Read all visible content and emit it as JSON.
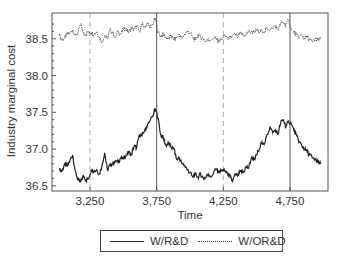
{
  "chart_data": {
    "type": "line",
    "title": "",
    "xlabel": "Time",
    "ylabel": "Industry marginal cost",
    "xlim": [
      2965,
      5035
    ],
    "ylim": [
      36.43,
      38.85
    ],
    "xticks": [
      3250,
      3750,
      4250,
      4750
    ],
    "xtick_labels": [
      "3,250",
      "3,750",
      "4,250",
      "4,750"
    ],
    "yticks": [
      36.5,
      37.0,
      37.5,
      38.0,
      38.5
    ],
    "ytick_labels": [
      "36.5",
      "37.0",
      "37.5",
      "38.0",
      "38.5"
    ],
    "grid": false,
    "vertical_lines": [
      {
        "x": 3250,
        "style": "dashed"
      },
      {
        "x": 3750,
        "style": "solid"
      },
      {
        "x": 4250,
        "style": "dashed"
      },
      {
        "x": 4750,
        "style": "solid"
      }
    ],
    "legend_position": "bottom",
    "series": [
      {
        "name": "W/R&D",
        "style": "solid",
        "x": [
          3020,
          3040,
          3060,
          3080,
          3100,
          3120,
          3140,
          3160,
          3180,
          3200,
          3220,
          3240,
          3260,
          3280,
          3300,
          3320,
          3340,
          3360,
          3380,
          3400,
          3420,
          3440,
          3460,
          3480,
          3500,
          3520,
          3540,
          3560,
          3580,
          3600,
          3620,
          3640,
          3660,
          3680,
          3700,
          3720,
          3740,
          3760,
          3780,
          3800,
          3820,
          3840,
          3860,
          3880,
          3900,
          3920,
          3940,
          3960,
          3980,
          4000,
          4020,
          4040,
          4060,
          4080,
          4100,
          4120,
          4140,
          4160,
          4180,
          4200,
          4220,
          4240,
          4260,
          4280,
          4300,
          4320,
          4340,
          4360,
          4380,
          4400,
          4420,
          4440,
          4460,
          4480,
          4500,
          4520,
          4540,
          4560,
          4580,
          4600,
          4620,
          4640,
          4660,
          4680,
          4700,
          4720,
          4740,
          4760,
          4780,
          4800,
          4820,
          4840,
          4860,
          4880,
          4900,
          4920,
          4940,
          4960,
          4980
        ],
        "values": [
          36.72,
          36.7,
          36.8,
          36.76,
          36.85,
          36.92,
          36.7,
          36.58,
          36.55,
          36.64,
          36.58,
          36.6,
          36.72,
          36.7,
          36.72,
          36.66,
          36.78,
          36.95,
          36.72,
          36.78,
          36.8,
          36.84,
          36.82,
          36.88,
          36.86,
          36.92,
          36.96,
          36.92,
          37.04,
          37.02,
          37.2,
          37.18,
          37.26,
          37.32,
          37.38,
          37.45,
          37.55,
          37.42,
          37.2,
          37.15,
          37.05,
          37.08,
          37.02,
          37.0,
          36.86,
          36.88,
          36.8,
          36.78,
          36.72,
          36.68,
          36.62,
          36.66,
          36.62,
          36.66,
          36.6,
          36.62,
          36.66,
          36.62,
          36.7,
          36.72,
          36.68,
          36.72,
          36.7,
          36.68,
          36.62,
          36.56,
          36.66,
          36.64,
          36.7,
          36.68,
          36.76,
          36.74,
          36.88,
          36.86,
          36.92,
          37.0,
          37.1,
          37.08,
          37.2,
          37.3,
          37.22,
          37.26,
          37.2,
          37.36,
          37.4,
          37.3,
          37.38,
          37.34,
          37.25,
          37.18,
          37.1,
          37.04,
          37.0,
          36.96,
          36.92,
          36.88,
          36.86,
          36.82,
          36.8
        ]
      },
      {
        "name": "W/OR&D",
        "style": "dotted",
        "x": [
          3020,
          3040,
          3060,
          3080,
          3100,
          3120,
          3140,
          3160,
          3180,
          3200,
          3220,
          3240,
          3260,
          3280,
          3300,
          3320,
          3340,
          3360,
          3380,
          3400,
          3420,
          3440,
          3460,
          3480,
          3500,
          3520,
          3540,
          3560,
          3580,
          3600,
          3620,
          3640,
          3660,
          3680,
          3700,
          3720,
          3740,
          3760,
          3780,
          3800,
          3820,
          3840,
          3860,
          3880,
          3900,
          3920,
          3940,
          3960,
          3980,
          4000,
          4020,
          4040,
          4060,
          4080,
          4100,
          4120,
          4140,
          4160,
          4180,
          4200,
          4220,
          4240,
          4260,
          4280,
          4300,
          4320,
          4340,
          4360,
          4380,
          4400,
          4420,
          4440,
          4460,
          4480,
          4500,
          4520,
          4540,
          4560,
          4580,
          4600,
          4620,
          4640,
          4660,
          4680,
          4700,
          4720,
          4740,
          4760,
          4780,
          4800,
          4820,
          4840,
          4860,
          4880,
          4900,
          4920,
          4940,
          4960,
          4980
        ],
        "values": [
          38.55,
          38.48,
          38.52,
          38.56,
          38.58,
          38.62,
          38.55,
          38.58,
          38.7,
          38.58,
          38.56,
          38.6,
          38.58,
          38.56,
          38.6,
          38.52,
          38.46,
          38.55,
          38.5,
          38.62,
          38.58,
          38.52,
          38.6,
          38.56,
          38.62,
          38.64,
          38.58,
          38.66,
          38.62,
          38.68,
          38.6,
          38.7,
          38.66,
          38.72,
          38.64,
          38.7,
          38.78,
          38.58,
          38.54,
          38.56,
          38.52,
          38.5,
          38.54,
          38.48,
          38.52,
          38.56,
          38.5,
          38.56,
          38.6,
          38.58,
          38.52,
          38.48,
          38.56,
          38.52,
          38.5,
          38.46,
          38.5,
          38.48,
          38.52,
          38.48,
          38.46,
          38.5,
          38.54,
          38.52,
          38.5,
          38.54,
          38.56,
          38.52,
          38.58,
          38.54,
          38.56,
          38.6,
          38.58,
          38.6,
          38.62,
          38.58,
          38.62,
          38.6,
          38.64,
          38.62,
          38.64,
          38.68,
          38.62,
          38.7,
          38.72,
          38.68,
          38.76,
          38.62,
          38.58,
          38.56,
          38.52,
          38.56,
          38.5,
          38.52,
          38.48,
          38.46,
          38.5,
          38.48,
          38.5
        ]
      }
    ]
  },
  "legend": {
    "items": [
      {
        "label": "W/R&D",
        "style": "solid"
      },
      {
        "label": "W/OR&D",
        "style": "dotted"
      }
    ]
  }
}
